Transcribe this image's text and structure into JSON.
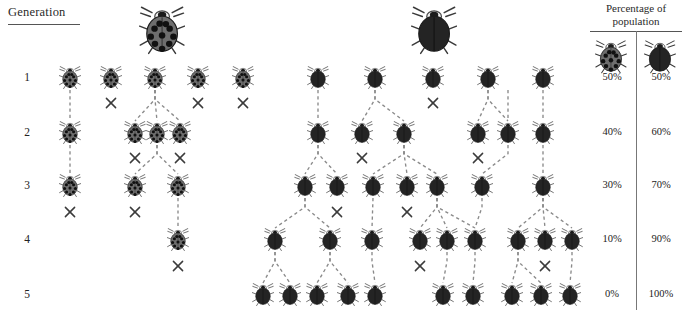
{
  "figure": {
    "type": "lineage-diagram",
    "generation_header": "Generation",
    "percentage_header_line1": "Percentage of",
    "percentage_header_line2": "population",
    "generation_labels": [
      "1",
      "2",
      "3",
      "4",
      "5"
    ],
    "morphs": [
      {
        "key": "spotted",
        "icon": "ladybug-spotted-icon",
        "body_color": "#6e6e6e",
        "spot_color": "#111111"
      },
      {
        "key": "dark",
        "icon": "ladybug-dark-icon",
        "body_color": "#242424",
        "spot_color": "#242424"
      }
    ],
    "legend": {
      "spotted_icon": "ladybug-spotted-icon",
      "dark_icon": "ladybug-dark-icon"
    },
    "death_marker": "x-cross-icon"
  },
  "chart_data": {
    "type": "table",
    "title": "Percentage of population",
    "categories": [
      "1",
      "2",
      "3",
      "4",
      "5"
    ],
    "xlabel": "Generation",
    "ylabel": "Percentage of population",
    "series": [
      {
        "name": "spotted",
        "values": [
          50,
          40,
          30,
          10,
          0
        ],
        "labels": [
          "50%",
          "40%",
          "30%",
          "10%",
          "0%"
        ]
      },
      {
        "name": "dark",
        "values": [
          50,
          60,
          70,
          90,
          100
        ],
        "labels": [
          "50%",
          "60%",
          "70%",
          "90%",
          "100%"
        ]
      }
    ],
    "counts": {
      "spotted": [
        5,
        4,
        3,
        1,
        0
      ],
      "dark": [
        5,
        6,
        7,
        9,
        10
      ]
    },
    "ylim": [
      0,
      100
    ],
    "grid": false,
    "legend_position": "top-right"
  },
  "rows": [
    {
      "generation": "1",
      "y": 78,
      "label_x": 30,
      "pct_spotted": "50%",
      "pct_dark": "50%",
      "bugs": [
        {
          "x": 70,
          "morph": "spotted"
        },
        {
          "x": 111,
          "morph": "spotted"
        },
        {
          "x": 155,
          "morph": "spotted"
        },
        {
          "x": 198,
          "morph": "spotted"
        },
        {
          "x": 243,
          "morph": "spotted"
        },
        {
          "x": 318,
          "morph": "dark"
        },
        {
          "x": 375,
          "morph": "dark"
        },
        {
          "x": 433,
          "morph": "dark"
        },
        {
          "x": 488,
          "morph": "dark"
        },
        {
          "x": 543,
          "morph": "dark"
        }
      ]
    },
    {
      "generation": "2",
      "y": 133,
      "label_x": 30,
      "pct_spotted": "40%",
      "pct_dark": "60%",
      "bugs": [
        {
          "x": 70,
          "morph": "spotted"
        },
        {
          "x": 135,
          "morph": "spotted"
        },
        {
          "x": 157,
          "morph": "spotted"
        },
        {
          "x": 180,
          "morph": "spotted"
        },
        {
          "x": 318,
          "morph": "dark"
        },
        {
          "x": 362,
          "morph": "dark"
        },
        {
          "x": 404,
          "morph": "dark"
        },
        {
          "x": 478,
          "morph": "dark"
        },
        {
          "x": 508,
          "morph": "dark"
        },
        {
          "x": 543,
          "morph": "dark"
        }
      ]
    },
    {
      "generation": "3",
      "y": 186,
      "label_x": 30,
      "pct_spotted": "30%",
      "pct_dark": "70%",
      "bugs": [
        {
          "x": 70,
          "morph": "spotted"
        },
        {
          "x": 135,
          "morph": "spotted"
        },
        {
          "x": 178,
          "morph": "spotted"
        },
        {
          "x": 305,
          "morph": "dark"
        },
        {
          "x": 337,
          "morph": "dark"
        },
        {
          "x": 373,
          "morph": "dark"
        },
        {
          "x": 407,
          "morph": "dark"
        },
        {
          "x": 437,
          "morph": "dark"
        },
        {
          "x": 482,
          "morph": "dark"
        },
        {
          "x": 543,
          "morph": "dark"
        }
      ]
    },
    {
      "generation": "4",
      "y": 240,
      "label_x": 30,
      "pct_spotted": "10%",
      "pct_dark": "90%",
      "bugs": [
        {
          "x": 178,
          "morph": "spotted"
        },
        {
          "x": 275,
          "morph": "dark"
        },
        {
          "x": 330,
          "morph": "dark"
        },
        {
          "x": 372,
          "morph": "dark"
        },
        {
          "x": 420,
          "morph": "dark"
        },
        {
          "x": 447,
          "morph": "dark"
        },
        {
          "x": 475,
          "morph": "dark"
        },
        {
          "x": 518,
          "morph": "dark"
        },
        {
          "x": 545,
          "morph": "dark"
        },
        {
          "x": 572,
          "morph": "dark"
        }
      ]
    },
    {
      "generation": "5",
      "y": 295,
      "label_x": 30,
      "pct_spotted": "0%",
      "pct_dark": "100%",
      "bugs": [
        {
          "x": 263,
          "morph": "dark"
        },
        {
          "x": 290,
          "morph": "dark"
        },
        {
          "x": 317,
          "morph": "dark"
        },
        {
          "x": 348,
          "morph": "dark"
        },
        {
          "x": 375,
          "morph": "dark"
        },
        {
          "x": 443,
          "morph": "dark"
        },
        {
          "x": 473,
          "morph": "dark"
        },
        {
          "x": 512,
          "morph": "dark"
        },
        {
          "x": 541,
          "morph": "dark"
        },
        {
          "x": 570,
          "morph": "dark"
        }
      ]
    }
  ],
  "header_icons": [
    {
      "name": "ladybug-spotted-large-icon",
      "x": 162,
      "y": 31,
      "morph": "spotted",
      "scale": 2.1
    },
    {
      "name": "ladybug-dark-large-icon",
      "x": 434,
      "y": 31,
      "morph": "dark",
      "scale": 2.1
    }
  ],
  "legend_icons": [
    {
      "name": "ladybug-spotted-legend-icon",
      "x": 611,
      "y": 57,
      "morph": "spotted",
      "scale": 1.45
    },
    {
      "name": "ladybug-dark-legend-icon",
      "x": 660,
      "y": 57,
      "morph": "dark",
      "scale": 1.45
    }
  ],
  "lineage_links": [
    {
      "from": [
        70,
        78
      ],
      "to": [
        70,
        133
      ]
    },
    {
      "from": [
        70,
        133
      ],
      "to": [
        70,
        186
      ]
    },
    {
      "from": [
        155,
        78
      ],
      "to": [
        135,
        133
      ]
    },
    {
      "from": [
        155,
        78
      ],
      "to": [
        157,
        133
      ]
    },
    {
      "from": [
        155,
        78
      ],
      "to": [
        180,
        133
      ]
    },
    {
      "from": [
        157,
        133
      ],
      "to": [
        135,
        186
      ]
    },
    {
      "from": [
        157,
        133
      ],
      "to": [
        178,
        186
      ]
    },
    {
      "from": [
        178,
        186
      ],
      "to": [
        178,
        240
      ]
    },
    {
      "from": [
        318,
        78
      ],
      "to": [
        318,
        133
      ]
    },
    {
      "from": [
        375,
        78
      ],
      "to": [
        362,
        133
      ]
    },
    {
      "from": [
        375,
        78
      ],
      "to": [
        404,
        133
      ]
    },
    {
      "from": [
        318,
        133
      ],
      "to": [
        305,
        186
      ]
    },
    {
      "from": [
        318,
        133
      ],
      "to": [
        337,
        186
      ]
    },
    {
      "from": [
        404,
        133
      ],
      "to": [
        373,
        186
      ]
    },
    {
      "from": [
        404,
        133
      ],
      "to": [
        407,
        186
      ]
    },
    {
      "from": [
        404,
        133
      ],
      "to": [
        437,
        186
      ]
    },
    {
      "from": [
        543,
        78
      ],
      "to": [
        543,
        133
      ]
    },
    {
      "from": [
        508,
        78
      ],
      "to": [
        508,
        133
      ]
    },
    {
      "from": [
        488,
        78
      ],
      "to": [
        478,
        133
      ]
    },
    {
      "from": [
        488,
        78
      ],
      "to": [
        508,
        133
      ]
    },
    {
      "from": [
        508,
        133
      ],
      "to": [
        482,
        186
      ]
    },
    {
      "from": [
        543,
        133
      ],
      "to": [
        543,
        186
      ]
    },
    {
      "from": [
        305,
        186
      ],
      "to": [
        275,
        240
      ]
    },
    {
      "from": [
        305,
        186
      ],
      "to": [
        330,
        240
      ]
    },
    {
      "from": [
        373,
        186
      ],
      "to": [
        372,
        240
      ]
    },
    {
      "from": [
        437,
        186
      ],
      "to": [
        420,
        240
      ]
    },
    {
      "from": [
        437,
        186
      ],
      "to": [
        447,
        240
      ]
    },
    {
      "from": [
        437,
        186
      ],
      "to": [
        475,
        240
      ]
    },
    {
      "from": [
        482,
        186
      ],
      "to": [
        475,
        240
      ]
    },
    {
      "from": [
        543,
        186
      ],
      "to": [
        518,
        240
      ]
    },
    {
      "from": [
        543,
        186
      ],
      "to": [
        545,
        240
      ]
    },
    {
      "from": [
        543,
        186
      ],
      "to": [
        572,
        240
      ]
    },
    {
      "from": [
        275,
        240
      ],
      "to": [
        263,
        295
      ]
    },
    {
      "from": [
        275,
        240
      ],
      "to": [
        290,
        295
      ]
    },
    {
      "from": [
        330,
        240
      ],
      "to": [
        317,
        295
      ]
    },
    {
      "from": [
        330,
        240
      ],
      "to": [
        348,
        295
      ]
    },
    {
      "from": [
        372,
        240
      ],
      "to": [
        375,
        295
      ]
    },
    {
      "from": [
        447,
        240
      ],
      "to": [
        443,
        295
      ]
    },
    {
      "from": [
        475,
        240
      ],
      "to": [
        473,
        295
      ]
    },
    {
      "from": [
        518,
        240
      ],
      "to": [
        512,
        295
      ]
    },
    {
      "from": [
        518,
        240
      ],
      "to": [
        541,
        295
      ]
    },
    {
      "from": [
        572,
        240
      ],
      "to": [
        570,
        295
      ]
    }
  ],
  "death_markers": [
    {
      "x": 111,
      "y": 103
    },
    {
      "x": 198,
      "y": 103
    },
    {
      "x": 243,
      "y": 103
    },
    {
      "x": 433,
      "y": 103
    },
    {
      "x": 135,
      "y": 158
    },
    {
      "x": 180,
      "y": 158
    },
    {
      "x": 362,
      "y": 158
    },
    {
      "x": 478,
      "y": 158
    },
    {
      "x": 70,
      "y": 212
    },
    {
      "x": 135,
      "y": 212
    },
    {
      "x": 337,
      "y": 212
    },
    {
      "x": 407,
      "y": 212
    },
    {
      "x": 178,
      "y": 266
    },
    {
      "x": 420,
      "y": 266
    },
    {
      "x": 545,
      "y": 266
    }
  ]
}
